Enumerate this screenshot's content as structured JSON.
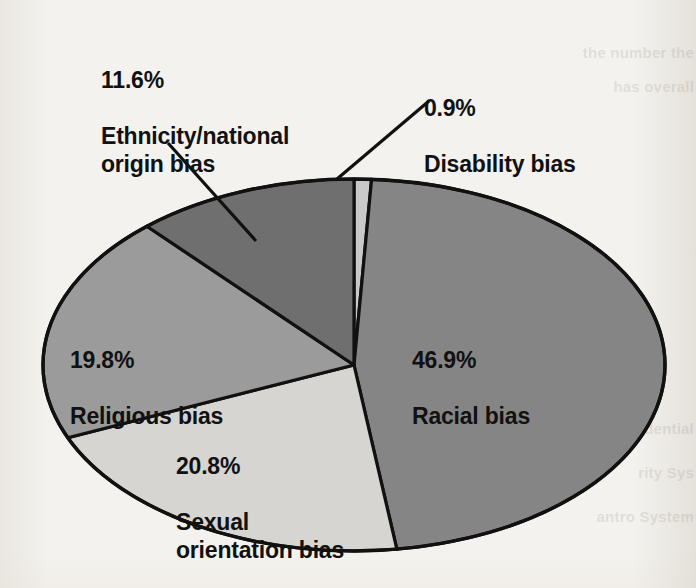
{
  "chart_data": {
    "type": "pie",
    "title": "",
    "subtitle": "",
    "xlabel": "",
    "ylabel": "",
    "legend_position": "none",
    "grid": false,
    "label_format": "percent + category name",
    "start_angle_deg": -90,
    "direction": "clockwise",
    "categories": [
      "Disability bias",
      "Racial bias",
      "Sexual orientation bias",
      "Religious bias",
      "Ethnicity/national origin bias"
    ],
    "values": [
      0.9,
      46.9,
      20.8,
      19.8,
      11.6
    ],
    "units": "percent",
    "total": 100.0,
    "slices": [
      {
        "name": "disability",
        "percent_label": "0.9%",
        "category_label": "Disability bias",
        "value": 0.9,
        "color": "#c9c9c9",
        "label_type": "callout",
        "has_leader_line": true
      },
      {
        "name": "racial",
        "percent_label": "46.9%",
        "category_label": "Racial bias",
        "value": 46.9,
        "color": "#858585",
        "label_type": "inside",
        "has_leader_line": false
      },
      {
        "name": "sexual-orientation",
        "percent_label": "20.8%",
        "category_label": "Sexual\norientation bias",
        "value": 20.8,
        "color": "#d6d5d1",
        "label_type": "inside",
        "has_leader_line": false
      },
      {
        "name": "religious",
        "percent_label": "19.8%",
        "category_label": "Religious bias",
        "value": 19.8,
        "color": "#9b9b9b",
        "label_type": "inside",
        "has_leader_line": false
      },
      {
        "name": "ethnicity",
        "percent_label": "11.6%",
        "category_label": "Ethnicity/national\norigin bias",
        "value": 11.6,
        "color": "#6f6f6f",
        "label_type": "callout",
        "has_leader_line": true
      }
    ]
  },
  "colors": {
    "background": "#f4f2ee",
    "outline": "#111111",
    "text": "#111111",
    "slice_racial": "#858585",
    "slice_sexual_orientation": "#d6d5d1",
    "slice_religious": "#9b9b9b",
    "slice_ethnicity": "#6f6f6f",
    "slice_disability": "#c9c9c9"
  },
  "bleed_through": {
    "line1": "the number the",
    "line2": "has overall",
    "line3": "dential",
    "line4": "rity Sys",
    "line5": "antro System"
  }
}
